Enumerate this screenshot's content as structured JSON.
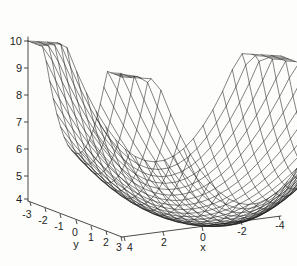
{
  "figure": {
    "kind": "3d-mesh-surface-plot",
    "background_color": "#fdfdfc",
    "line_color": "#1d1d1d",
    "width": 297,
    "height": 266
  },
  "axes": {
    "x": {
      "title": "x",
      "ticks": [
        "4",
        "2",
        "0",
        "-2",
        "-4"
      ],
      "values": [
        4,
        2,
        0,
        -2,
        -4
      ],
      "range": [
        -4,
        4
      ],
      "direction": "decreasing-left-to-right"
    },
    "y": {
      "title": "y",
      "ticks": [
        "-3",
        "-2",
        "-1",
        "0",
        "1",
        "2",
        "3"
      ],
      "values": [
        -3,
        -2,
        -1,
        0,
        1,
        2,
        3
      ],
      "range": [
        -3,
        3
      ],
      "direction": "increasing-left-to-right"
    },
    "z": {
      "title": "",
      "ticks": [
        "4",
        "5",
        "6",
        "7",
        "8",
        "9",
        "10"
      ],
      "values": [
        4,
        5,
        6,
        7,
        8,
        9,
        10
      ],
      "range": [
        3.5,
        10.6
      ],
      "direction": "increasing-upward"
    }
  },
  "chart_data": {
    "type": "surface",
    "title": "",
    "xlabel": "x",
    "ylabel": "y",
    "zlabel": "",
    "xlim": [
      -4,
      4
    ],
    "ylim": [
      -3,
      3
    ],
    "zlim": [
      3.5,
      10.6
    ],
    "grid": false,
    "legend": false,
    "mesh": {
      "style": "wireframe",
      "nx": 26,
      "ny": 26,
      "line_color": "#1d1d1d",
      "face_color": "none"
    },
    "surface_description": "Bowl-shaped (paraboloid-like) wireframe surface with a flat low basin near the center rising steeply to four raised corners; the back corner is the tallest peak.",
    "z_min": 3.6,
    "z_max": 10.6,
    "notable_points": [
      {
        "label": "back peak (tallest)",
        "z": 10.6
      },
      {
        "label": "left corner",
        "z": 10.3
      },
      {
        "label": "right corner",
        "z": 9.6
      },
      {
        "label": "front-left minor peak",
        "z": 8.8
      },
      {
        "label": "basin minimum",
        "z": 3.6
      }
    ]
  }
}
